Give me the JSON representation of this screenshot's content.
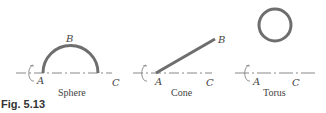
{
  "figure": {
    "caption": "Fig. 5.13",
    "panels": [
      {
        "name": "Sphere",
        "caption": "Sphere",
        "labels": {
          "a": "A",
          "b": "B",
          "c": "C"
        },
        "shape": "semicircle"
      },
      {
        "name": "Cone",
        "caption": "Cone",
        "labels": {
          "a": "A",
          "b": "B",
          "c": "C"
        },
        "shape": "line-segment"
      },
      {
        "name": "Torus",
        "caption": "Torus",
        "labels": {
          "a": "A",
          "c": "C"
        },
        "shape": "circle"
      }
    ],
    "colors": {
      "curve": "#6e6e6e",
      "axis": "#888888",
      "text": "#444444"
    }
  }
}
